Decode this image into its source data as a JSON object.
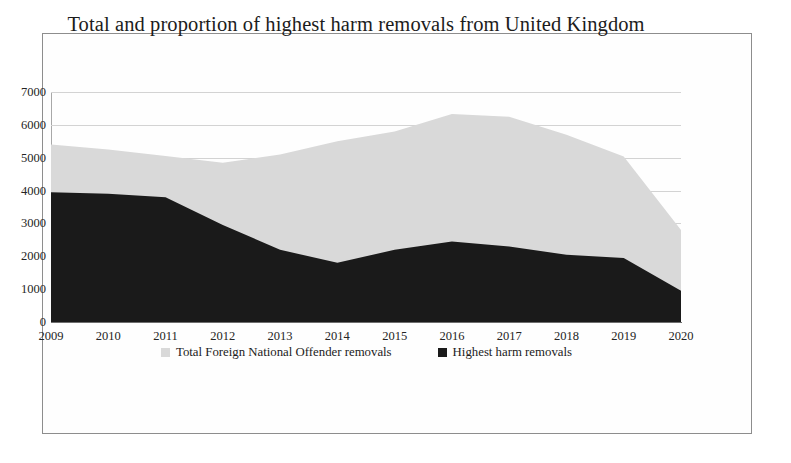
{
  "figure": {
    "title": "Total and proportion of highest harm removals from United Kingdom",
    "frame_color": "#8d8d8d",
    "background": "#ffffff"
  },
  "chart_data": {
    "type": "area",
    "title": "Total and proportion of highest harm removals from United Kingdom",
    "subtitle": "",
    "xlabel": "",
    "ylabel": "",
    "categories": [
      "2009",
      "2010",
      "2011",
      "2012",
      "2013",
      "2014",
      "2015",
      "2016",
      "2017",
      "2018",
      "2019",
      "2020"
    ],
    "x": [
      2009,
      2010,
      2011,
      2012,
      2013,
      2014,
      2015,
      2016,
      2017,
      2018,
      2019,
      2020
    ],
    "series": [
      {
        "name": "Total Foreign National Offender removals",
        "color": "#d9d9d9",
        "values": [
          5400,
          5250,
          5050,
          4850,
          5100,
          5500,
          5800,
          6330,
          6250,
          5700,
          5040,
          2800
        ]
      },
      {
        "name": "Highest harm removals",
        "color": "#1a1a1a",
        "values": [
          3950,
          3900,
          3800,
          2950,
          2200,
          1800,
          2200,
          2450,
          2300,
          2050,
          1950,
          950
        ]
      }
    ],
    "ylim": [
      0,
      7000
    ],
    "yticks": [
      0,
      1000,
      2000,
      3000,
      4000,
      5000,
      6000,
      7000
    ],
    "ytick_labels": [
      "0",
      "1000",
      "2000",
      "3000",
      "4000",
      "5000",
      "6000",
      "7000"
    ],
    "xlim": [
      2009,
      2020
    ],
    "grid": true,
    "grid_axis": "y",
    "legend_position": "bottom-center",
    "stacked": false,
    "note": "Light grey area is the total; the dark area is the highest-harm subset drawn in front of it."
  },
  "legend": {
    "entries": [
      {
        "label": "Total Foreign National Offender removals",
        "color": "#d9d9d9",
        "marker": "square-swatch"
      },
      {
        "label": "Highest harm removals",
        "color": "#1a1a1a",
        "marker": "square-swatch"
      }
    ]
  }
}
